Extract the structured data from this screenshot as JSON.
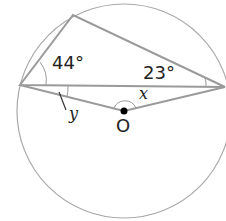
{
  "diagram": {
    "angles": {
      "a": "44°",
      "b": "23°"
    },
    "variables": {
      "x": "x",
      "y": "y"
    },
    "center_label": "O",
    "line_color": "#9a9a9a"
  }
}
